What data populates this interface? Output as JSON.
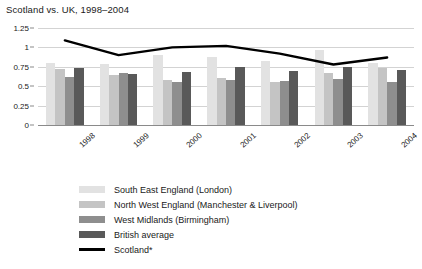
{
  "chart_data": {
    "type": "bar",
    "title": "Scotland vs. UK, 1998–2004",
    "xlabel": "",
    "ylabel": "",
    "ylim": [
      0,
      1.25
    ],
    "ytick_labels": [
      "1.25",
      "1",
      "0.75",
      "0.5",
      "0.25",
      "0"
    ],
    "ytick_values": [
      1.25,
      1,
      0.75,
      0.5,
      0.25,
      0
    ],
    "grid": true,
    "legend_position": "bottom-left",
    "categories": [
      "1998",
      "1999",
      "2000",
      "2001",
      "2002",
      "2003",
      "2004"
    ],
    "series": [
      {
        "name": "South East England (London)",
        "type": "bar",
        "color": "#e2e2e2",
        "values": [
          0.8,
          0.78,
          0.9,
          0.88,
          0.83,
          0.97,
          0.8
        ]
      },
      {
        "name": "North West England (Manchester & Liverpool)",
        "type": "bar",
        "color": "#c4c4c4",
        "values": [
          0.72,
          0.64,
          0.58,
          0.6,
          0.55,
          0.67,
          0.73
        ]
      },
      {
        "name": "West Midlands (Birmingham)",
        "type": "bar",
        "color": "#8e8e8e",
        "values": [
          0.62,
          0.67,
          0.55,
          0.58,
          0.57,
          0.59,
          0.56
        ]
      },
      {
        "name": "British average",
        "type": "bar",
        "color": "#595959",
        "values": [
          0.74,
          0.66,
          0.68,
          0.75,
          0.7,
          0.75,
          0.71
        ]
      },
      {
        "name": "Scotland*",
        "type": "line",
        "color": "#000000",
        "values": [
          1.09,
          0.9,
          1.0,
          1.02,
          0.92,
          0.78,
          0.87
        ]
      }
    ]
  }
}
